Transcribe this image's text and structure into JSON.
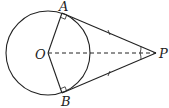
{
  "diagram": {
    "type": "geometry",
    "points": {
      "O": {
        "label": "O",
        "x": 48,
        "y": 53
      },
      "A": {
        "label": "A",
        "x": 62,
        "y": 13
      },
      "B": {
        "label": "B",
        "x": 62,
        "y": 93
      },
      "P": {
        "label": "P",
        "x": 156,
        "y": 53
      }
    },
    "circle": {
      "center": "O",
      "radius": 42
    },
    "segments": [
      {
        "from": "O",
        "to": "A",
        "style": "solid"
      },
      {
        "from": "O",
        "to": "B",
        "style": "solid"
      },
      {
        "from": "A",
        "to": "P",
        "style": "solid",
        "tick_marks": 1
      },
      {
        "from": "B",
        "to": "P",
        "style": "solid",
        "tick_marks": 1
      },
      {
        "from": "O",
        "to": "P",
        "style": "dashed"
      }
    ],
    "right_angles": [
      "OAP",
      "OBP"
    ],
    "angle_marks": [
      "APO",
      "BPO"
    ],
    "colors": {
      "stroke": "#222222",
      "background": "#ffffff"
    }
  }
}
